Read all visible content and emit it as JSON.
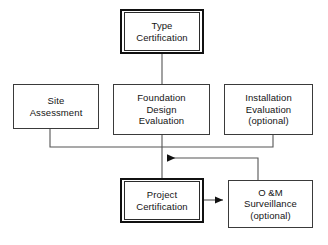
{
  "diagram": {
    "background_color": "#ffffff",
    "line_color": "#555555",
    "emphasis_border_color": "#111111",
    "node_border_color": "#3a3a3a",
    "nodes": [
      {
        "id": "type-certification",
        "label": "Type\nCertification",
        "style": "double",
        "x": 120,
        "y": 9,
        "w": 84,
        "h": 45
      },
      {
        "id": "site-assessment",
        "label": "Site\nAssessment",
        "style": "single",
        "x": 13,
        "y": 84,
        "w": 86,
        "h": 45
      },
      {
        "id": "foundation-design-evaluation",
        "label": "Foundation\nDesign\nEvaluation",
        "style": "single",
        "x": 113,
        "y": 84,
        "w": 97,
        "h": 51
      },
      {
        "id": "installation-evaluation",
        "label": "Installation\nEvaluation\n(optional)",
        "style": "single",
        "x": 224,
        "y": 84,
        "w": 89,
        "h": 51
      },
      {
        "id": "project-certification",
        "label": "Project\nCertification",
        "style": "double",
        "x": 120,
        "y": 178,
        "w": 84,
        "h": 45
      },
      {
        "id": "om-surveillance",
        "label": "O &M\nSurveillance\n(optional)",
        "style": "single",
        "x": 228,
        "y": 180,
        "w": 85,
        "h": 48
      }
    ],
    "edges": [
      {
        "id": "type-to-foundation",
        "from": "type-certification",
        "to": "foundation-design-evaluation",
        "arrow": false,
        "points": "162,54 162,84"
      },
      {
        "id": "foundation-to-project",
        "from": "foundation-design-evaluation",
        "to": "project-certification",
        "arrow": false,
        "points": "162,135 162,178"
      },
      {
        "id": "site-assessment-to-junction",
        "from": "site-assessment",
        "to": "project-certification",
        "arrow": false,
        "points": "50,129 50,147 162,147"
      },
      {
        "id": "installation-to-junction",
        "from": "installation-evaluation",
        "to": "project-certification",
        "arrow": false,
        "points": "273,135 273,147 162,147"
      },
      {
        "id": "om-feedback-to-junction",
        "from": "om-surveillance",
        "to": "project-certification",
        "arrow": true,
        "arrow_direction": "left",
        "points": "258,180 258,158 166,158"
      },
      {
        "id": "project-to-om",
        "from": "project-certification",
        "to": "om-surveillance",
        "arrow": true,
        "arrow_direction": "right",
        "points": "204,200 224,200"
      }
    ]
  }
}
